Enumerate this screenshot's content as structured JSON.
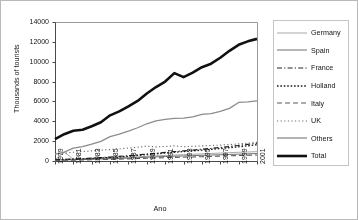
{
  "chart_data": {
    "type": "line",
    "title": "",
    "xlabel": "Ano",
    "ylabel": "Thousands of tourists",
    "xlim": [
      1979,
      2001
    ],
    "ylim": [
      0,
      14000
    ],
    "yticks": [
      0,
      2000,
      4000,
      6000,
      8000,
      10000,
      12000,
      14000
    ],
    "xticks": [
      1979,
      1981,
      1983,
      1985,
      1987,
      1989,
      1991,
      1993,
      1995,
      1997,
      1999,
      2001
    ],
    "x": [
      1979,
      1980,
      1981,
      1982,
      1983,
      1984,
      1985,
      1986,
      1987,
      1988,
      1989,
      1990,
      1991,
      1992,
      1993,
      1994,
      1995,
      1996,
      1997,
      1998,
      1999,
      2000,
      2001
    ],
    "grid": false,
    "legend_position": "right",
    "series": [
      {
        "name": "Germany",
        "style": "solid",
        "color": "#a8a8a8",
        "width": 1,
        "values": [
          120,
          900,
          180,
          200,
          230,
          260,
          300,
          330,
          370,
          420,
          470,
          520,
          560,
          600,
          640,
          680,
          720,
          760,
          800,
          840,
          880,
          910,
          940
        ]
      },
      {
        "name": "Spain",
        "style": "solid",
        "color": "#6e6e6e",
        "width": 1,
        "values": [
          90,
          110,
          130,
          150,
          175,
          200,
          230,
          260,
          300,
          340,
          380,
          420,
          450,
          480,
          510,
          540,
          570,
          600,
          630,
          660,
          690,
          720,
          750
        ]
      },
      {
        "name": "France",
        "style": "dash-dot",
        "color": "#222222",
        "width": 1.2,
        "values": [
          150,
          170,
          200,
          240,
          290,
          340,
          400,
          470,
          540,
          620,
          700,
          780,
          860,
          940,
          1020,
          1100,
          1180,
          1270,
          1360,
          1460,
          1560,
          1680,
          1800
        ]
      },
      {
        "name": "Holland",
        "style": "dotted",
        "color": "#1a1a1a",
        "width": 1.3,
        "values": [
          130,
          150,
          180,
          210,
          250,
          300,
          350,
          410,
          480,
          560,
          640,
          720,
          800,
          880,
          950,
          1020,
          1090,
          1170,
          1250,
          1340,
          1430,
          1530,
          1640
        ]
      },
      {
        "name": "Italy",
        "style": "dashed",
        "color": "#5a5a5a",
        "width": 1.1,
        "values": [
          60,
          70,
          85,
          100,
          120,
          140,
          165,
          190,
          215,
          245,
          275,
          305,
          335,
          360,
          385,
          410,
          435,
          460,
          490,
          520,
          550,
          580,
          610
        ]
      },
      {
        "name": "UK",
        "style": "fine-dotted",
        "color": "#6a6a6a",
        "width": 1.1,
        "values": [
          700,
          780,
          880,
          950,
          1020,
          1090,
          1160,
          1230,
          1300,
          1380,
          1500,
          1420,
          1460,
          1520,
          1440,
          1480,
          1520,
          1560,
          1600,
          1660,
          1720,
          1800,
          1880
        ]
      },
      {
        "name": "Others",
        "style": "solid",
        "color": "#8c8c8c",
        "width": 1.3,
        "values": [
          700,
          900,
          1300,
          1450,
          1700,
          1980,
          2450,
          2700,
          3000,
          3350,
          3750,
          4050,
          4200,
          4300,
          4320,
          4450,
          4700,
          4780,
          5000,
          5300,
          5900,
          5960,
          6050
        ]
      },
      {
        "name": "Total",
        "style": "solid",
        "color": "#111111",
        "width": 2.6,
        "values": [
          2200,
          2700,
          3050,
          3150,
          3500,
          3900,
          4600,
          5000,
          5500,
          6050,
          6800,
          7450,
          8000,
          8850,
          8450,
          8900,
          9450,
          9800,
          10400,
          11100,
          11700,
          12050,
          12300
        ]
      }
    ]
  },
  "axis": {
    "y_ticks": [
      "0",
      "2000",
      "4000",
      "6000",
      "8000",
      "10000",
      "12000",
      "14000"
    ],
    "x_ticks": [
      "1979",
      "1981",
      "1983",
      "1985",
      "1987",
      "1989",
      "1991",
      "1993",
      "1995",
      "1997",
      "1999",
      "2001"
    ],
    "x_title": "Ano",
    "y_title": "Thousands of tourists"
  },
  "legend": {
    "items": [
      {
        "label": "Germany"
      },
      {
        "label": "Spain"
      },
      {
        "label": "France"
      },
      {
        "label": "Holland"
      },
      {
        "label": "Italy"
      },
      {
        "label": "UK"
      },
      {
        "label": "Others"
      },
      {
        "label": "Total"
      }
    ]
  }
}
